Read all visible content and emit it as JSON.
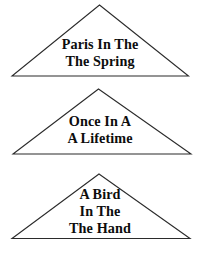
{
  "page": {
    "background_color": "#ffffff",
    "stroke_color": "#2b2b2b",
    "text_color": "#0d0d0d"
  },
  "figures": [
    {
      "shape": "triangle",
      "label": "paris-in-the-spring",
      "lines": [
        "Paris In The",
        "The Spring"
      ]
    },
    {
      "shape": "triangle",
      "label": "once-in-a-lifetime",
      "lines": [
        "Once In A",
        "A Lifetime"
      ]
    },
    {
      "shape": "triangle",
      "label": "a-bird-in-the-hand",
      "lines": [
        "A Bird",
        "In The",
        "The Hand"
      ]
    }
  ]
}
